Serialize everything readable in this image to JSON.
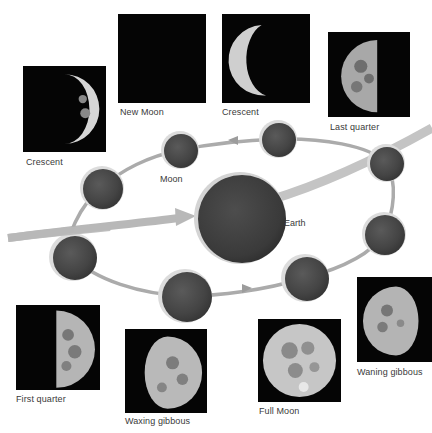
{
  "diagram": {
    "earth_label": "Earth",
    "moon_label": "Moon",
    "colors": {
      "background": "#ffffff",
      "photo_background": "#050505",
      "sphere_fill": "#4a4a4a",
      "sphere_highlight": "#d9d9d9",
      "orbit": "#a8a8a8",
      "sunlight_arrow": "#b3b3b3",
      "label_text": "#3a3a3a"
    }
  },
  "phases": [
    {
      "id": "crescent-left",
      "label": "Crescent"
    },
    {
      "id": "new-moon",
      "label": "New Moon"
    },
    {
      "id": "crescent-top",
      "label": "Crescent"
    },
    {
      "id": "last-quarter",
      "label": "Last quarter"
    },
    {
      "id": "first-quarter",
      "label": "First quarter"
    },
    {
      "id": "waxing-gibbous",
      "label": "Waxing gibbous"
    },
    {
      "id": "full-moon",
      "label": "Full Moon"
    },
    {
      "id": "waning-gibbous",
      "label": "Waning gibbous"
    }
  ]
}
